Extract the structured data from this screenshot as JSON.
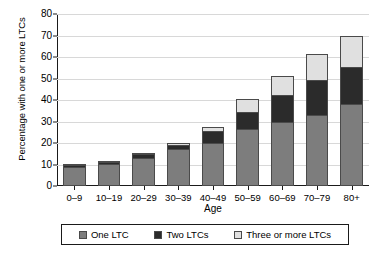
{
  "chart_data": {
    "type": "bar",
    "stacked": true,
    "title": "",
    "xlabel": "Age",
    "ylabel": "Percentage with one or more LTCs",
    "categories": [
      "0–9",
      "10–19",
      "20–29",
      "30–39",
      "40–49",
      "50–59",
      "60–69",
      "70–79",
      "80+"
    ],
    "series": [
      {
        "name": "One LTC",
        "color": "#7d7d7d",
        "values": [
          9.0,
          10.2,
          13.2,
          17.2,
          20.0,
          26.5,
          30.0,
          33.0,
          38.3
        ]
      },
      {
        "name": "Two LTCs",
        "color": "#2b2b2b",
        "values": [
          0.9,
          1.1,
          1.7,
          2.1,
          5.4,
          8.0,
          12.5,
          16.5,
          17.0
        ]
      },
      {
        "name": "Three or more LTCs",
        "color": "#e0e0e0",
        "values": [
          0.1,
          0.1,
          0.2,
          0.7,
          2.0,
          6.0,
          8.5,
          12.0,
          14.5
        ]
      }
    ],
    "totals": [
      10.0,
      11.4,
      15.1,
      20.0,
      27.4,
      40.5,
      51.0,
      61.5,
      69.8
    ],
    "ylim": [
      0,
      80
    ],
    "yticks": [
      0,
      10,
      20,
      30,
      40,
      50,
      60,
      70,
      80
    ],
    "grid": true,
    "legend_position": "bottom"
  },
  "legend": {
    "items": [
      {
        "label": "One LTC",
        "color": "#7d7d7d"
      },
      {
        "label": "Two LTCs",
        "color": "#2b2b2b"
      },
      {
        "label": "Three or more LTCs",
        "color": "#e0e0e0"
      }
    ]
  }
}
